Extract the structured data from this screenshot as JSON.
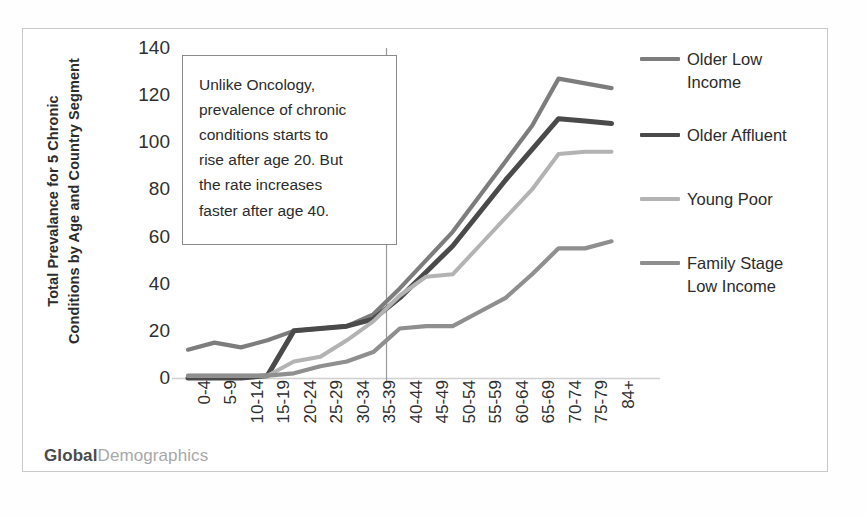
{
  "chart_data": {
    "type": "line",
    "title": "",
    "xlabel": "",
    "ylabel": "Total Prevalance for 5 Chronic Conditions by Age and Country Segment",
    "ylabel_lines": [
      "Total Prevalance for 5 Chronic",
      "Conditions by Age and Country Segment"
    ],
    "ylim": [
      0,
      140
    ],
    "yticks": [
      0,
      20,
      40,
      60,
      80,
      100,
      120,
      140
    ],
    "grid": false,
    "legend_position": "right",
    "categories": [
      "0-4",
      "5-9",
      "10-14",
      "15-19",
      "20-24",
      "25-29",
      "30-34",
      "35-39",
      "40-44",
      "45-49",
      "50-54",
      "55-59",
      "60-64",
      "65-69",
      "70-74",
      "75-79",
      "84+"
    ],
    "series": [
      {
        "name": "Older Low Income",
        "color": "#7d7d7d",
        "values": [
          12,
          15,
          13,
          16,
          20,
          21,
          22,
          27,
          38,
          50,
          62,
          77,
          92,
          107,
          127,
          125,
          123
        ]
      },
      {
        "name": "Older Affluent",
        "color": "#4a4a4a",
        "values": [
          0,
          0,
          0,
          1,
          20,
          21,
          22,
          25,
          34,
          45,
          56,
          70,
          84,
          97,
          110,
          109,
          108
        ]
      },
      {
        "name": "Young Poor",
        "color": "#b3b3b3",
        "values": [
          1,
          1,
          1,
          1,
          7,
          9,
          16,
          24,
          35,
          43,
          44,
          56,
          68,
          80,
          95,
          96,
          96
        ]
      },
      {
        "name": "Family Stage Low Income",
        "color": "#8f8f8f",
        "values": [
          1,
          1,
          1,
          1,
          2,
          5,
          7,
          11,
          21,
          22,
          22,
          28,
          34,
          44,
          55,
          55,
          58
        ]
      }
    ],
    "reference_line": {
      "at_category": "35-39",
      "label": ""
    },
    "annotation": {
      "lines": [
        "Unlike Oncology,",
        "prevalence of chronic",
        "conditions starts to",
        "rise after age 20.  But",
        "the rate increases",
        "faster after age 40."
      ]
    }
  },
  "legend": {
    "items": [
      {
        "label": "Older Low\nIncome",
        "color": "#7d7d7d"
      },
      {
        "label": "Older Affluent",
        "color": "#4a4a4a"
      },
      {
        "label": "Young Poor",
        "color": "#b3b3b3"
      },
      {
        "label": "Family Stage\nLow Income",
        "color": "#8f8f8f"
      }
    ]
  },
  "footer": {
    "brand_bold": "Global",
    "brand_light": "Demographics"
  }
}
